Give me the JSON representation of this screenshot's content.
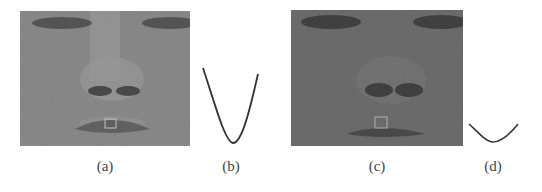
{
  "figure": {
    "panels": [
      {
        "id": "a",
        "label": "(a)",
        "type": "image",
        "content": "grayscale face crop with small ROI box on lips",
        "brightness": "normal"
      },
      {
        "id": "b",
        "label": "(b)",
        "type": "curve",
        "content": "deep V-shaped parabolic profile curve"
      },
      {
        "id": "c",
        "label": "(c)",
        "type": "image",
        "content": "darker noisy grayscale face crop with small ROI box on lips",
        "brightness": "dark"
      },
      {
        "id": "d",
        "label": "(d)",
        "type": "curve",
        "content": "shallow V-shaped parabolic profile curve"
      }
    ],
    "colors": {
      "face_a_base": "#8a8a8a",
      "face_c_base": "#6a6a6a",
      "curve_stroke": "#333333",
      "roi_box": "#c8c8c8"
    }
  }
}
